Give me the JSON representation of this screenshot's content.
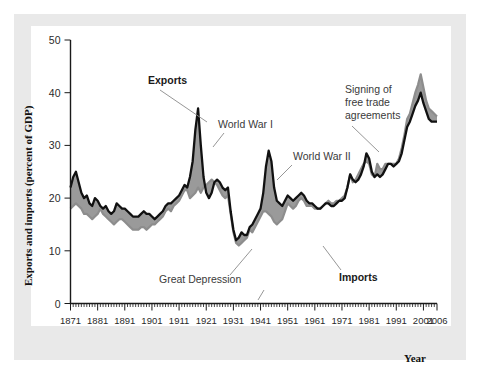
{
  "figure": {
    "background_color": "#e9e9e9",
    "plot_background_color": "#ffffff",
    "export_line_color": "#111111",
    "import_band_color": "#9a9a9a"
  },
  "axis": {
    "y_title": "Exports and imports (percent of GDP)",
    "x_title": "Year",
    "y_ticks": [
      "0",
      "10",
      "20",
      "30",
      "40",
      "50"
    ],
    "x_ticks": [
      "1871",
      "1881",
      "1891",
      "1901",
      "1911",
      "1921",
      "1931",
      "1941",
      "1951",
      "1961",
      "1971",
      "1981",
      "1991",
      "2001",
      "2006"
    ]
  },
  "annotations": {
    "exports": "Exports",
    "imports": "Imports",
    "ww1": "World War I",
    "ww2": "World War II",
    "great_depression": "Great Depression",
    "free_trade_line1": "Signing of",
    "free_trade_line2": "free trade",
    "free_trade_line3": "agreements"
  },
  "chart_data": {
    "type": "area",
    "title": "",
    "xlabel": "Year",
    "ylabel": "Exports and imports (percent of GDP)",
    "xlim": [
      1871,
      2006
    ],
    "ylim": [
      0,
      50
    ],
    "grid": false,
    "legend": "inline-annotations",
    "x": [
      1871,
      1872,
      1873,
      1874,
      1875,
      1876,
      1877,
      1878,
      1879,
      1880,
      1881,
      1882,
      1883,
      1884,
      1885,
      1886,
      1887,
      1888,
      1889,
      1890,
      1891,
      1892,
      1893,
      1894,
      1895,
      1896,
      1897,
      1898,
      1899,
      1900,
      1901,
      1902,
      1903,
      1904,
      1905,
      1906,
      1907,
      1908,
      1909,
      1910,
      1911,
      1912,
      1913,
      1914,
      1915,
      1916,
      1917,
      1918,
      1919,
      1920,
      1921,
      1922,
      1923,
      1924,
      1925,
      1926,
      1927,
      1928,
      1929,
      1930,
      1931,
      1932,
      1933,
      1934,
      1935,
      1936,
      1937,
      1938,
      1939,
      1940,
      1941,
      1942,
      1943,
      1944,
      1945,
      1946,
      1947,
      1948,
      1949,
      1950,
      1951,
      1952,
      1953,
      1954,
      1955,
      1956,
      1957,
      1958,
      1959,
      1960,
      1961,
      1962,
      1963,
      1964,
      1965,
      1966,
      1967,
      1968,
      1969,
      1970,
      1971,
      1972,
      1973,
      1974,
      1975,
      1976,
      1977,
      1978,
      1979,
      1980,
      1981,
      1982,
      1983,
      1984,
      1985,
      1986,
      1987,
      1988,
      1989,
      1990,
      1991,
      1992,
      1993,
      1994,
      1995,
      1996,
      1997,
      1998,
      1999,
      2000,
      2001,
      2002,
      2003,
      2004,
      2005,
      2006
    ],
    "series": [
      {
        "name": "Exports",
        "color": "#111111",
        "style": "solid-black-line",
        "values": [
          22.0,
          24.0,
          25.0,
          23.0,
          21.0,
          20.0,
          20.5,
          19.0,
          18.5,
          20.0,
          19.5,
          18.5,
          18.0,
          18.5,
          17.5,
          17.0,
          17.5,
          19.0,
          18.5,
          18.0,
          18.0,
          17.5,
          17.0,
          16.5,
          16.5,
          16.5,
          17.0,
          17.5,
          17.0,
          17.0,
          16.5,
          16.0,
          16.5,
          17.0,
          17.5,
          18.5,
          19.0,
          19.0,
          19.5,
          20.0,
          20.5,
          21.5,
          22.5,
          22.0,
          24.0,
          27.0,
          33.0,
          37.0,
          30.0,
          24.0,
          21.0,
          20.0,
          21.0,
          23.0,
          23.5,
          23.0,
          22.0,
          21.5,
          22.0,
          17.5,
          14.0,
          12.0,
          12.5,
          13.5,
          13.0,
          13.0,
          14.5,
          15.0,
          16.0,
          17.0,
          18.0,
          21.0,
          26.0,
          29.0,
          27.0,
          22.0,
          19.5,
          19.0,
          18.5,
          19.5,
          20.5,
          20.0,
          19.5,
          20.0,
          20.5,
          21.0,
          20.5,
          19.5,
          19.0,
          19.0,
          18.5,
          18.0,
          18.0,
          18.5,
          19.0,
          19.0,
          18.5,
          18.5,
          19.0,
          19.5,
          19.5,
          20.0,
          22.0,
          24.5,
          23.5,
          23.0,
          23.5,
          24.5,
          26.0,
          28.5,
          27.5,
          25.0,
          24.0,
          24.5,
          24.0,
          24.5,
          25.5,
          26.5,
          26.5,
          26.0,
          26.5,
          27.0,
          28.5,
          31.0,
          33.5,
          34.5,
          36.0,
          37.5,
          38.5,
          40.0,
          38.0,
          36.5,
          35.0,
          34.5,
          34.5,
          34.5
        ]
      },
      {
        "name": "Imports",
        "color": "#9a9a9a",
        "style": "gray-band-boundary",
        "values": [
          18.0,
          18.5,
          19.0,
          18.5,
          18.0,
          17.0,
          17.0,
          16.5,
          16.0,
          16.5,
          17.0,
          18.0,
          17.0,
          16.5,
          16.0,
          15.5,
          15.0,
          15.5,
          16.0,
          16.0,
          15.5,
          15.0,
          14.5,
          14.0,
          14.0,
          14.0,
          14.5,
          14.5,
          14.0,
          14.5,
          15.0,
          15.0,
          15.5,
          16.0,
          16.5,
          17.5,
          18.0,
          17.5,
          18.5,
          19.0,
          19.5,
          20.5,
          21.5,
          21.5,
          20.0,
          20.5,
          21.0,
          22.0,
          21.0,
          22.0,
          22.5,
          23.0,
          23.5,
          23.0,
          22.5,
          21.5,
          20.5,
          20.0,
          20.5,
          17.0,
          13.5,
          11.5,
          11.0,
          11.5,
          12.0,
          12.5,
          14.0,
          13.5,
          14.5,
          15.5,
          16.5,
          17.5,
          17.5,
          17.0,
          16.5,
          15.5,
          15.0,
          15.5,
          16.0,
          17.5,
          19.0,
          18.5,
          18.0,
          18.5,
          19.5,
          20.0,
          19.5,
          18.5,
          18.5,
          18.5,
          18.0,
          18.0,
          18.0,
          18.5,
          19.0,
          19.5,
          19.0,
          19.0,
          19.5,
          19.5,
          20.0,
          20.5,
          22.0,
          24.5,
          23.0,
          23.5,
          24.5,
          25.5,
          26.5,
          27.0,
          26.5,
          24.5,
          24.0,
          26.5,
          25.5,
          25.5,
          26.5,
          26.5,
          26.5,
          26.5,
          26.5,
          27.5,
          29.5,
          32.0,
          35.0,
          36.0,
          38.0,
          40.0,
          41.5,
          43.5,
          41.0,
          38.5,
          37.0,
          36.5,
          36.0,
          35.5
        ]
      }
    ],
    "annotation_points": [
      {
        "label": "Exports",
        "x": 1918,
        "y": 37
      },
      {
        "label": "World War I",
        "x": 1917,
        "y": 33
      },
      {
        "label": "World War II",
        "x": 1944,
        "y": 29
      },
      {
        "label": "Great Depression",
        "x": 1933,
        "y": 12
      },
      {
        "label": "Imports",
        "x": 1964,
        "y": 18
      },
      {
        "label": "Signing of free trade agreements",
        "x": 1989,
        "y": 26
      }
    ]
  }
}
